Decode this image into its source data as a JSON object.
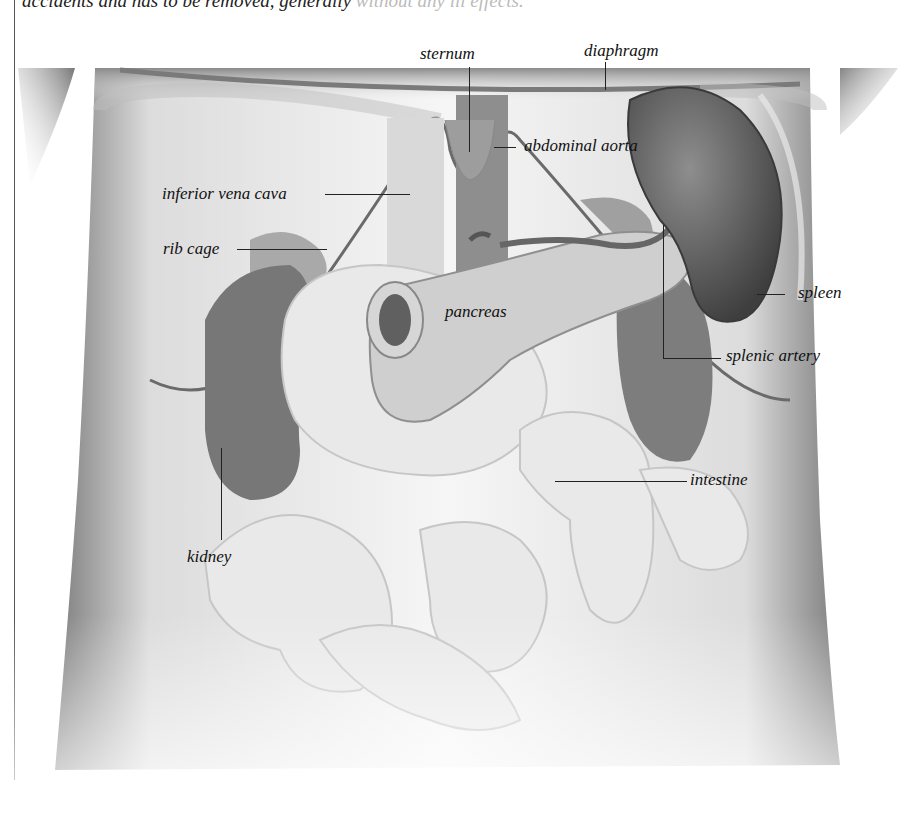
{
  "document": {
    "top_text": {
      "main": "accidents and has to be removed, generally",
      "faded": " without any ill effects."
    }
  },
  "figure": {
    "labels": {
      "sternum": "sternum",
      "diaphragm": "diaphragm",
      "abdominal_aorta": "abdominal aorta",
      "inferior_vena_cava": "inferior vena cava",
      "rib_cage": "rib cage",
      "pancreas": "pancreas",
      "spleen": "spleen",
      "splenic_artery": "splenic artery",
      "intestine": "intestine",
      "kidney": "kidney"
    },
    "colors": {
      "skin_light": "#f2f2f2",
      "skin_shadow": "#8a8a8a",
      "organ_dark": "#6e6e6e",
      "organ_mid": "#9a9a9a",
      "organ_light": "#cfcfcf",
      "intestine": "#e6e6e6",
      "label_text": "#111111"
    }
  }
}
